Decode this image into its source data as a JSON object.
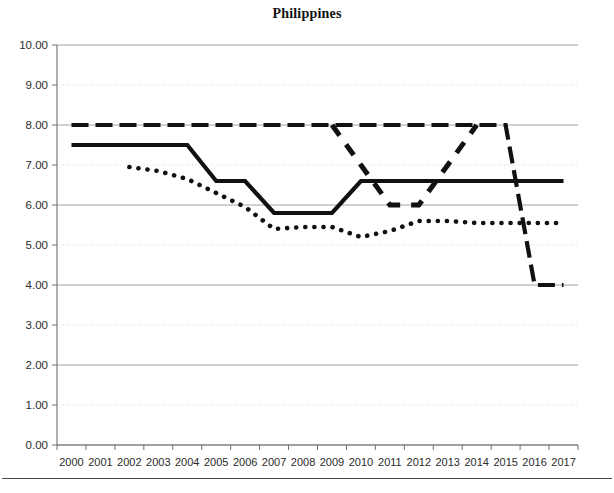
{
  "chart_data": {
    "type": "line",
    "title": "Philippines",
    "xlabel": "",
    "ylabel": "",
    "ylim": [
      0,
      10
    ],
    "ytick_step": 1,
    "grid": true,
    "legend": "none",
    "categories": [
      "2000",
      "2001",
      "2002",
      "2003",
      "2004",
      "2005",
      "2006",
      "2007",
      "2008",
      "2009",
      "2010",
      "2011",
      "2012",
      "2013",
      "2014",
      "2015",
      "2016",
      "2017"
    ],
    "ytick_labels": [
      "10.00",
      "9.00",
      "8.00",
      "7.00",
      "6.00",
      "5.00",
      "4.00",
      "3.00",
      "2.00",
      "1.00",
      "0.00"
    ],
    "series": [
      {
        "name": "series-dashed-top",
        "style": "dashed",
        "values": [
          8.0,
          8.0,
          8.0,
          8.0,
          8.0,
          8.0,
          8.0,
          8.0,
          8.0,
          8.0,
          8.0,
          8.0,
          8.0,
          8.0,
          8.0,
          8.0,
          4.0,
          4.0
        ]
      },
      {
        "name": "series-solid",
        "style": "solid",
        "values": [
          7.5,
          7.5,
          7.5,
          7.5,
          7.5,
          6.6,
          6.6,
          5.8,
          5.8,
          5.8,
          6.6,
          6.6,
          6.6,
          6.6,
          6.6,
          6.6,
          6.6,
          6.6
        ]
      },
      {
        "name": "series-dotted",
        "style": "dotted",
        "values": [
          null,
          null,
          6.95,
          6.85,
          6.65,
          6.3,
          5.95,
          5.4,
          5.45,
          5.45,
          5.2,
          5.35,
          5.6,
          5.6,
          5.55,
          5.55,
          5.55,
          5.55
        ]
      },
      {
        "name": "series-dashed-dip",
        "style": "dashed-heavy",
        "values": [
          null,
          null,
          null,
          null,
          null,
          null,
          null,
          null,
          null,
          8.0,
          7.0,
          6.0,
          6.0,
          7.0,
          8.0,
          null,
          null,
          null
        ]
      }
    ]
  },
  "axis": {
    "y_min_label": "0.00",
    "y_max_label": "10.00"
  },
  "colors": {
    "series_ink": "#111111",
    "grid": "#9a9a9a",
    "axis": "#6f6f6f",
    "text": "#2b2b2b"
  }
}
